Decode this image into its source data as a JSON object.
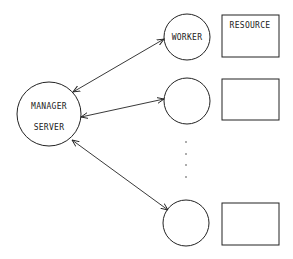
{
  "diagram": {
    "manager": {
      "line1": "MANAGER",
      "line2": "SERVER"
    },
    "workers": [
      {
        "label": "WORKER",
        "resource_label": "RESOURCE"
      },
      {
        "label": "",
        "resource_label": ""
      },
      {
        "label": "",
        "resource_label": ""
      }
    ],
    "ellipsis": "· · · ·",
    "colors": {
      "stroke": "#222222",
      "background": "#ffffff"
    }
  }
}
